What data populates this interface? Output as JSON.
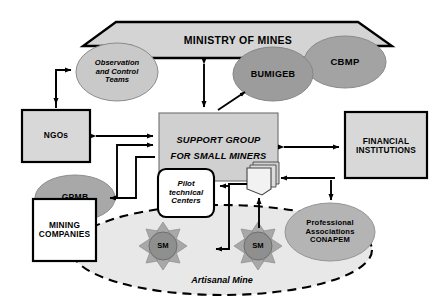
{
  "diagram": {
    "colors": {
      "banner_fill": "#d4d4d4",
      "box_fill": "#d8d8d8",
      "ellipse_light": "#c9c9c9",
      "ellipse_mid": "#a3a3a3",
      "ellipse_dark": "#9a9a9a",
      "sun_ray": "#a8a8a8",
      "sun_core": "#8f8f8f",
      "mine_fill": "#e6e6e6",
      "stroke": "#000000",
      "white": "#ffffff"
    },
    "nodes": {
      "ministry": {
        "label": "MINISTRY OF MINES",
        "shape": "banner-hexagon"
      },
      "observation": {
        "label": "Observation\nand Control\nTeams",
        "shape": "ellipse"
      },
      "bumigeb": {
        "label": "BUMIGEB",
        "shape": "ellipse"
      },
      "cbmp": {
        "label": "CBMP",
        "shape": "ellipse"
      },
      "ngos": {
        "label": "NGOs",
        "shape": "rect"
      },
      "support_group": {
        "label": "SUPPORT GROUP\nFOR SMALL MINERS",
        "shape": "rect"
      },
      "financial": {
        "label": "FINANCIAL\nINSTITUTIONS",
        "shape": "rect"
      },
      "pilot_centers": {
        "label": "Pilot\ntechnical\nCenters",
        "shape": "rounded-rect"
      },
      "gpmb": {
        "label": "GPMB",
        "shape": "ellipse"
      },
      "mining_companies": {
        "label": "MINING\nCOMPANIES",
        "shape": "rect"
      },
      "professional": {
        "label": "Professional\nAssociations\nCONAPEM",
        "shape": "ellipse"
      },
      "documents": {
        "label": "",
        "shape": "document-stack"
      },
      "sm_left": {
        "label": "SM",
        "shape": "sunburst"
      },
      "sm_right": {
        "label": "SM",
        "shape": "sunburst"
      },
      "artisanal_mine": {
        "label": "Artisanal Mine",
        "shape": "dashed-ellipse"
      }
    },
    "edges": [
      {
        "from": "ministry",
        "to": "support_group",
        "style": "double-arrow"
      },
      {
        "from": "observation",
        "to": "ngos",
        "style": "elbow-double"
      },
      {
        "from": "ngos",
        "to": "support_group",
        "style": "double-arrow"
      },
      {
        "from": "support_group",
        "to": "bumigeb",
        "style": "arrow"
      },
      {
        "from": "support_group",
        "to": "financial",
        "style": "double-arrow"
      },
      {
        "from": "support_group",
        "to": "gpmb",
        "style": "elbow-arrow"
      },
      {
        "from": "gpmb",
        "to": "support_group",
        "style": "elbow-arrow"
      },
      {
        "from": "financial",
        "to": "professional",
        "style": "arrow"
      },
      {
        "from": "professional",
        "to": "documents",
        "style": "arrow"
      },
      {
        "from": "documents",
        "to": "pilot_centers",
        "style": "elbow-arrow"
      },
      {
        "from": "pilot_centers",
        "to": "sm_right",
        "style": "elbow-arrow"
      },
      {
        "from": "sm_right",
        "to": "documents",
        "style": "arrow"
      }
    ]
  }
}
